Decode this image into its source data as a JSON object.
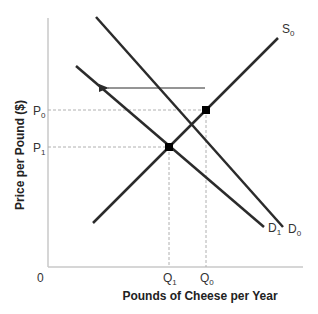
{
  "diagram": {
    "type": "supply-demand",
    "x_axis": {
      "title": "Pounds of Cheese per Year",
      "origin_label": "0"
    },
    "y_axis": {
      "title": "Price per Pound ($)"
    },
    "curves": [
      {
        "id": "S0",
        "label": "S",
        "sub": "0",
        "kind": "supply"
      },
      {
        "id": "D0",
        "label": "D",
        "sub": "0",
        "kind": "demand"
      },
      {
        "id": "D1",
        "label": "D",
        "sub": "1",
        "kind": "demand"
      }
    ],
    "price_ticks": [
      {
        "label": "P",
        "sub": "0"
      },
      {
        "label": "P",
        "sub": "1"
      }
    ],
    "quantity_ticks": [
      {
        "label": "Q",
        "sub": "1"
      },
      {
        "label": "Q",
        "sub": "0"
      }
    ],
    "equilibria": [
      {
        "id": "E0",
        "curves": [
          "S0",
          "D0"
        ],
        "price": "P0",
        "quantity": "Q0"
      },
      {
        "id": "E1",
        "curves": [
          "S0",
          "D1"
        ],
        "price": "P1",
        "quantity": "Q1"
      }
    ],
    "shift_arrow": {
      "from": "D0",
      "to": "D1",
      "direction": "left"
    },
    "colors": {
      "curve": "#2b2b2b",
      "axis": "#c8c8c8",
      "guide": "#b0b0b0",
      "point": "#000000"
    }
  }
}
